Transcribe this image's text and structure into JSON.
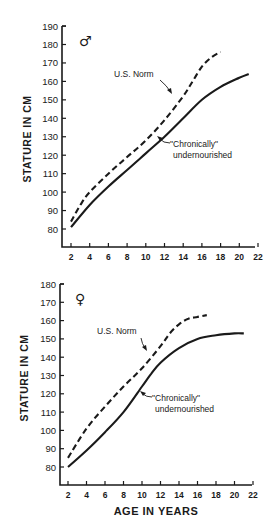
{
  "chart_data": [
    {
      "type": "line",
      "panel": "male",
      "sex_symbol": "♂",
      "title": "",
      "xlabel": "",
      "ylabel": "STATURE IN CM",
      "x_ticks": [
        2,
        4,
        6,
        8,
        10,
        12,
        14,
        16,
        18,
        20,
        22
      ],
      "y_ticks": [
        80,
        90,
        100,
        110,
        120,
        130,
        140,
        150,
        160,
        170,
        180,
        190
      ],
      "xlim": [
        0.5,
        23
      ],
      "ylim": [
        70,
        190
      ],
      "grid": false,
      "series": [
        {
          "name": "U.S. Norm",
          "style": "dashed",
          "x": [
            2,
            3,
            4,
            6,
            8,
            10,
            12,
            14,
            15,
            16,
            17,
            18
          ],
          "y": [
            84,
            93,
            100,
            110,
            119,
            128,
            139,
            152,
            160,
            168,
            173,
            176
          ]
        },
        {
          "name": "\"Chronically\" undernourished",
          "style": "solid",
          "x": [
            2,
            4,
            6,
            8,
            10,
            12,
            14,
            16,
            18,
            20,
            21
          ],
          "y": [
            81,
            93,
            103,
            112,
            121,
            130,
            140,
            150,
            157,
            162,
            164
          ]
        }
      ],
      "annotations": [
        {
          "text": "U.S. Norm",
          "arrow_to": "dashed"
        },
        {
          "text": "\"Chronically\"",
          "arrow_to": "solid"
        },
        {
          "text": "undernourished"
        }
      ]
    },
    {
      "type": "line",
      "panel": "female",
      "sex_symbol": "♀",
      "title": "",
      "xlabel": "AGE IN YEARS",
      "ylabel": "STATURE IN CM",
      "x_ticks": [
        2,
        4,
        6,
        8,
        10,
        12,
        14,
        16,
        18,
        20,
        22
      ],
      "y_ticks": [
        80,
        90,
        100,
        110,
        120,
        130,
        140,
        150,
        160,
        170,
        180
      ],
      "xlim": [
        0.5,
        23
      ],
      "ylim": [
        70,
        180
      ],
      "grid": false,
      "series": [
        {
          "name": "U.S. Norm",
          "style": "dashed",
          "x": [
            2,
            4,
            6,
            8,
            10,
            12,
            13,
            14,
            15,
            16,
            17
          ],
          "y": [
            85,
            101,
            113,
            124,
            134,
            146,
            153,
            158,
            161,
            162,
            163
          ]
        },
        {
          "name": "\"Chronically\" undernourished",
          "style": "solid",
          "x": [
            2,
            4,
            6,
            8,
            10,
            11,
            12,
            14,
            16,
            18,
            20,
            21
          ],
          "y": [
            80,
            89,
            99,
            110,
            124,
            131,
            137,
            145,
            150,
            152,
            153,
            153
          ]
        }
      ],
      "annotations": [
        {
          "text": "U.S. Norm",
          "arrow_to": "dashed"
        },
        {
          "text": "\"Chronically\"",
          "arrow_to": "solid"
        },
        {
          "text": "undernourished"
        }
      ]
    }
  ],
  "labels": {
    "ylabel": "STATURE IN CM",
    "xlabel": "AGE IN YEARS",
    "male_symbol": "♂",
    "female_symbol": "♀",
    "us_norm": "U.S. Norm",
    "chronically": "\"Chronically\"",
    "undernourished": "undernourished"
  },
  "colors": {
    "ink": "#1a1a1a",
    "background": "#ffffff"
  }
}
